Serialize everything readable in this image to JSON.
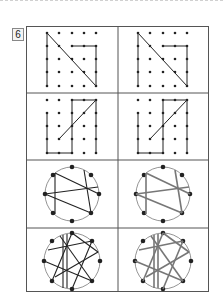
{
  "problem": {
    "number": "6"
  },
  "colors": {
    "line_dark": "#222222",
    "line_gray": "#777777",
    "border": "#555555"
  },
  "panels": [
    {
      "row": 1,
      "left": "grid-figure-original",
      "right": "grid-figure-copy"
    },
    {
      "row": 2,
      "left": "grid-figure-original",
      "right": "grid-figure-copy"
    },
    {
      "row": 3,
      "left": "circle-figure-original",
      "right": "circle-figure-copy-gray"
    },
    {
      "row": 4,
      "left": "circle-figure-original",
      "right": "circle-figure-copy-gray"
    }
  ]
}
